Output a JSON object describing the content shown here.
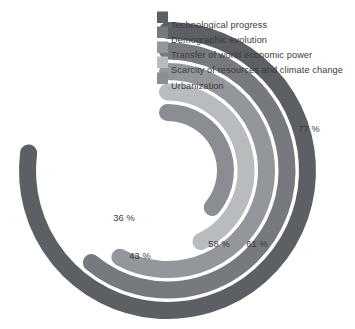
{
  "chart_data": {
    "type": "bar",
    "variant": "radial-bar",
    "title": "",
    "subtitle": "",
    "xlabel": "",
    "ylabel": "",
    "value_suffix": " %",
    "axis_max": 100,
    "start_angle_deg": 0,
    "direction": "clockwise",
    "grid": false,
    "legend_position": "top-right",
    "categories": [
      "Technological progress",
      "Demographic evolution",
      "Transfer of world economic power",
      "Scarcity of resources and climate change",
      "Urbanization"
    ],
    "values": [
      77,
      61,
      58,
      43,
      36
    ],
    "value_labels": [
      "77 %",
      "61 %",
      "58 %",
      "43 %",
      "36 %"
    ],
    "colors": [
      "#5c5f63",
      "#76797d",
      "#93969a",
      "#b9bcbf",
      "#8a8d91"
    ],
    "series": [
      {
        "name": "Technological progress",
        "value": 77,
        "label": "77 %",
        "color": "#5c5f63",
        "ring": 1
      },
      {
        "name": "Demographic evolution",
        "value": 61,
        "label": "61 %",
        "color": "#76797d",
        "ring": 2
      },
      {
        "name": "Transfer of world economic power",
        "value": 58,
        "label": "58 %",
        "color": "#93969a",
        "ring": 3
      },
      {
        "name": "Scarcity of resources and climate change",
        "value": 43,
        "label": "43 %",
        "color": "#b9bcbf",
        "ring": 4
      },
      {
        "name": "Urbanization",
        "value": 36,
        "label": "36 %",
        "color": "#8a8d91",
        "ring": 5
      }
    ]
  },
  "legend": {
    "items": [
      {
        "label": "Technological progress",
        "color": "#5c5f63"
      },
      {
        "label": "Demographic evolution",
        "color": "#76797d"
      },
      {
        "label": "Transfer of world economic power",
        "color": "#93969a"
      },
      {
        "label": "Scarcity of resources and climate change",
        "color": "#b9bcbf"
      },
      {
        "label": "Urbanization",
        "color": "#8a8d91"
      }
    ]
  },
  "value_callouts": [
    {
      "label": "77 %",
      "x": 309,
      "y": 132
    },
    {
      "label": "61 %",
      "x": 257,
      "y": 247
    },
    {
      "label": "58 %",
      "x": 219,
      "y": 247
    },
    {
      "label": "43 %",
      "x": 140,
      "y": 259
    },
    {
      "label": "36 %",
      "x": 124,
      "y": 221
    }
  ]
}
